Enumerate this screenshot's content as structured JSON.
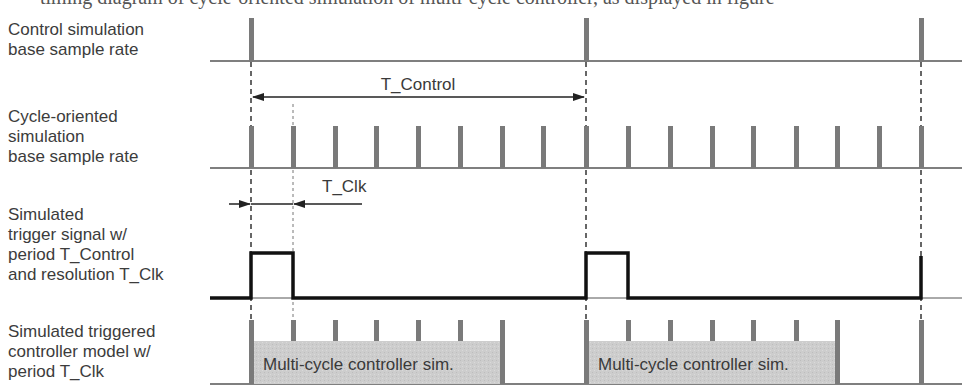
{
  "diagram": {
    "top_caption": "timing diagram of cycle-oriented simulation of multi-cycle controller, as displayed in figure",
    "rows": [
      {
        "id": "control",
        "label": "Control simulation\nbase sample rate"
      },
      {
        "id": "cycle",
        "label": "Cycle-oriented\nsimulation\nbase sample rate"
      },
      {
        "id": "trigger",
        "label": "Simulated\ntrigger signal w/\nperiod T_Control\nand resolution T_Clk"
      },
      {
        "id": "controller",
        "label": "Simulated triggered\ncontroller model w/\nperiod T_Clk"
      }
    ],
    "annotations": {
      "t_control": "T_Control",
      "t_clk": "T_Clk"
    },
    "blocks": [
      {
        "label": "Multi-cycle controller sim."
      },
      {
        "label": "Multi-cycle controller sim."
      }
    ],
    "colors": {
      "tick": "#7a7a7a",
      "line": "#555555",
      "signal": "#111111",
      "block_fill": "#cfcfcf",
      "text": "#3a3a3a"
    }
  }
}
